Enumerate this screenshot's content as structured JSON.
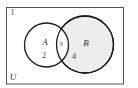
{
  "figure": {
    "type": "venn-diagram",
    "universe_label": "U",
    "background_color": "#ffffff",
    "border_color": "#555555",
    "outline_color": "#1a1a1a"
  },
  "regions": {
    "outside_label": "1",
    "a_only_label": "2",
    "intersection_label": "3",
    "b_only_label": "4"
  },
  "sets": {
    "a": {
      "name": "A",
      "fill": "#ffffff"
    },
    "b": {
      "name": "B",
      "fill": "#ededed"
    }
  }
}
